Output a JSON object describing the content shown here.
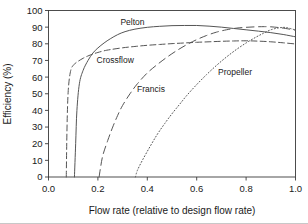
{
  "chart_data": {
    "type": "line",
    "title": "",
    "xlabel": "Flow rate (relative to design flow rate)",
    "ylabel": "Efficiency (%)",
    "xlim": [
      0.0,
      1.0
    ],
    "ylim": [
      0,
      100
    ],
    "grid": false,
    "legend_position": "inline-annotations",
    "xticks": [
      "0.0",
      "0.2",
      "0.4",
      "0.6",
      "0.8",
      "1.0"
    ],
    "xtick_values": [
      0.0,
      0.2,
      0.4,
      0.6,
      0.8,
      1.0
    ],
    "yticks": [
      "0",
      "10",
      "20",
      "30",
      "40",
      "50",
      "60",
      "70",
      "80",
      "90",
      "100"
    ],
    "ytick_values": [
      0,
      10,
      20,
      30,
      40,
      50,
      60,
      70,
      80,
      90,
      100
    ],
    "series": [
      {
        "name": "Pelton",
        "style": "solid",
        "label_x": 0.34,
        "label_y": 93,
        "x": [
          0.105,
          0.11,
          0.115,
          0.125,
          0.14,
          0.16,
          0.18,
          0.2,
          0.225,
          0.25,
          0.28,
          0.31,
          0.35,
          0.4,
          0.45,
          0.5,
          0.55,
          0.6,
          0.65,
          0.7,
          0.75,
          0.8,
          0.85,
          0.9,
          0.95,
          1.0
        ],
        "y": [
          0,
          20,
          40,
          56,
          64,
          70,
          74.5,
          77.5,
          80.5,
          83,
          85.5,
          87.3,
          88.8,
          89.9,
          90.5,
          90.9,
          91.0,
          91.0,
          90.6,
          90.0,
          89.2,
          88.4,
          87.6,
          86.7,
          85.6,
          84.2
        ]
      },
      {
        "name": "Crossflow",
        "style": "dashed",
        "label_x": 0.27,
        "label_y": 70,
        "x": [
          0.072,
          0.075,
          0.08,
          0.09,
          0.105,
          0.12,
          0.14,
          0.16,
          0.18,
          0.2,
          0.225,
          0.25,
          0.3,
          0.35,
          0.4,
          0.45,
          0.5,
          0.55,
          0.6,
          0.65,
          0.7,
          0.75,
          0.8,
          0.85,
          0.9,
          0.95,
          1.0
        ],
        "y": [
          0,
          30,
          52,
          64,
          67.8,
          69.5,
          71.3,
          72.7,
          73.9,
          74.8,
          75.8,
          76.5,
          77.6,
          78.4,
          79.1,
          79.6,
          80.1,
          80.5,
          80.9,
          81.2,
          81.5,
          81.7,
          81.8,
          81.6,
          81.2,
          80.6,
          79.9
        ]
      },
      {
        "name": "Francis",
        "style": "long-dash",
        "label_x": 0.415,
        "label_y": 53,
        "x": [
          0.205,
          0.21,
          0.22,
          0.24,
          0.26,
          0.28,
          0.3,
          0.33,
          0.36,
          0.4,
          0.44,
          0.48,
          0.52,
          0.56,
          0.6,
          0.64,
          0.68,
          0.72,
          0.76,
          0.8,
          0.84,
          0.875,
          0.9,
          0.93,
          0.96,
          1.0
        ],
        "y": [
          0,
          5,
          13,
          22,
          30,
          37,
          43,
          50,
          56,
          62.5,
          67.5,
          72,
          76,
          79.5,
          82.5,
          85,
          87,
          88.4,
          89.4,
          89.9,
          90.2,
          90.3,
          90.2,
          89.8,
          89.2,
          88.2
        ]
      },
      {
        "name": "Propeller",
        "style": "dotted",
        "label_x": 0.755,
        "label_y": 63,
        "x": [
          0.352,
          0.36,
          0.38,
          0.41,
          0.44,
          0.47,
          0.5,
          0.53,
          0.56,
          0.6,
          0.64,
          0.68,
          0.72,
          0.76,
          0.8,
          0.84,
          0.87,
          0.9,
          0.93,
          0.96,
          1.0
        ],
        "y": [
          0,
          4,
          10,
          18,
          25.5,
          32,
          38,
          43.5,
          49,
          55.5,
          61.5,
          67,
          72,
          76.5,
          80.5,
          84,
          86.3,
          88.4,
          89.5,
          89.8,
          88.3
        ]
      }
    ]
  }
}
